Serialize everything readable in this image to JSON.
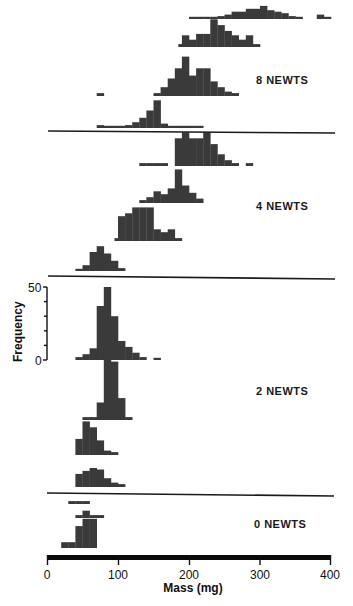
{
  "chart_data": {
    "type": "bar",
    "title": "",
    "xlabel": "Mass (mg)",
    "ylabel": "Frequency",
    "xlim": [
      0,
      400
    ],
    "x_ticks": [
      0,
      100,
      200,
      300,
      400
    ],
    "y_ticks_scale": [
      0,
      50
    ],
    "y_tick_labels": [
      "0",
      "50"
    ],
    "bin_width_mg": 10,
    "grid": false,
    "groups": [
      {
        "label": "8 NEWTS",
        "histograms": [
          {
            "name": "8 newts row 1",
            "bins": [
              [
                200,
                1
              ],
              [
                210,
                1
              ],
              [
                220,
                1
              ],
              [
                230,
                1
              ],
              [
                240,
                2
              ],
              [
                250,
                3
              ],
              [
                260,
                5
              ],
              [
                270,
                5
              ],
              [
                280,
                7
              ],
              [
                290,
                7
              ],
              [
                300,
                9
              ],
              [
                310,
                6
              ],
              [
                320,
                5
              ],
              [
                330,
                4
              ],
              [
                340,
                2
              ],
              [
                350,
                1
              ],
              [
                380,
                3
              ],
              [
                390,
                1
              ]
            ]
          },
          {
            "name": "8 newts row 2",
            "bins": [
              [
                185,
                2
              ],
              [
                190,
                8
              ],
              [
                200,
                5
              ],
              [
                210,
                9
              ],
              [
                220,
                9
              ],
              [
                230,
                19
              ],
              [
                240,
                15
              ],
              [
                250,
                11
              ],
              [
                260,
                8
              ],
              [
                270,
                5
              ],
              [
                280,
                8
              ],
              [
                290,
                2
              ]
            ]
          },
          {
            "name": "8 newts row 3",
            "bins": [
              [
                70,
                2
              ],
              [
                150,
                2
              ],
              [
                160,
                6
              ],
              [
                170,
                12
              ],
              [
                180,
                19
              ],
              [
                190,
                27
              ],
              [
                200,
                14
              ],
              [
                210,
                19
              ],
              [
                220,
                19
              ],
              [
                230,
                10
              ],
              [
                240,
                6
              ],
              [
                250,
                3
              ],
              [
                260,
                2
              ]
            ]
          },
          {
            "name": "8 newts row 4",
            "bins": [
              [
                70,
                2
              ],
              [
                80,
                1
              ],
              [
                90,
                1
              ],
              [
                100,
                1
              ],
              [
                110,
                2
              ],
              [
                120,
                4
              ],
              [
                130,
                7
              ],
              [
                140,
                12
              ],
              [
                150,
                19
              ],
              [
                160,
                3
              ],
              [
                170,
                1
              ],
              [
                180,
                1
              ],
              [
                190,
                1
              ],
              [
                200,
                1
              ],
              [
                210,
                1
              ]
            ]
          }
        ]
      },
      {
        "label": "4 NEWTS",
        "histograms": [
          {
            "name": "4 newts row 1",
            "bins": [
              [
                130,
                2
              ],
              [
                140,
                2
              ],
              [
                150,
                2
              ],
              [
                160,
                2
              ],
              [
                180,
                19
              ],
              [
                190,
                23
              ],
              [
                200,
                19
              ],
              [
                210,
                19
              ],
              [
                220,
                23
              ],
              [
                230,
                15
              ],
              [
                240,
                8
              ],
              [
                250,
                4
              ],
              [
                260,
                2
              ],
              [
                280,
                2
              ]
            ]
          },
          {
            "name": "4 newts row 2",
            "bins": [
              [
                130,
                2
              ],
              [
                140,
                4
              ],
              [
                150,
                8
              ],
              [
                160,
                6
              ],
              [
                170,
                10
              ],
              [
                180,
                23
              ],
              [
                190,
                12
              ],
              [
                200,
                7
              ],
              [
                210,
                3
              ]
            ]
          },
          {
            "name": "4 newts row 3",
            "bins": [
              [
                95,
                2
              ],
              [
                100,
                17
              ],
              [
                110,
                19
              ],
              [
                120,
                23
              ],
              [
                130,
                23
              ],
              [
                140,
                23
              ],
              [
                150,
                8
              ],
              [
                160,
                6
              ],
              [
                170,
                8
              ],
              [
                180,
                2
              ]
            ]
          },
          {
            "name": "4 newts row 4",
            "bins": [
              [
                40,
                1
              ],
              [
                50,
                4
              ],
              [
                60,
                13
              ],
              [
                70,
                17
              ],
              [
                80,
                12
              ],
              [
                90,
                7
              ],
              [
                100,
                2
              ]
            ]
          }
        ]
      },
      {
        "label": "2 NEWTS",
        "histograms": [
          {
            "name": "2 newts row 1",
            "bins": [
              [
                40,
                2
              ],
              [
                50,
                4
              ],
              [
                60,
                8
              ],
              [
                70,
                37
              ],
              [
                80,
                50
              ],
              [
                90,
                30
              ],
              [
                100,
                13
              ],
              [
                110,
                9
              ],
              [
                120,
                5
              ],
              [
                130,
                2
              ],
              [
                150,
                1
              ]
            ]
          },
          {
            "name": "2 newts row 2",
            "bins": [
              [
                50,
                2
              ],
              [
                60,
                2
              ],
              [
                70,
                12
              ],
              [
                80,
                48
              ],
              [
                90,
                40
              ],
              [
                100,
                15
              ],
              [
                110,
                2
              ]
            ]
          },
          {
            "name": "2 newts row 3",
            "bins": [
              [
                40,
                11
              ],
              [
                50,
                23
              ],
              [
                60,
                19
              ],
              [
                70,
                10
              ],
              [
                80,
                3
              ],
              [
                90,
                2
              ]
            ]
          },
          {
            "name": "2 newts row 4",
            "bins": [
              [
                40,
                9
              ],
              [
                50,
                11
              ],
              [
                60,
                13
              ],
              [
                70,
                12
              ],
              [
                80,
                6
              ],
              [
                90,
                3
              ],
              [
                100,
                2
              ]
            ]
          }
        ]
      },
      {
        "label": "0 NEWTS",
        "histograms": [
          {
            "name": "0 newts row 1",
            "bins": [
              [
                30,
                2
              ],
              [
                40,
                2
              ],
              [
                50,
                2
              ]
            ]
          },
          {
            "name": "0 newts row 2",
            "bins": [
              [
                40,
                2
              ],
              [
                50,
                5
              ],
              [
                60,
                2
              ],
              [
                70,
                2
              ]
            ]
          },
          {
            "name": "0 newts row 3",
            "bins": [
              [
                20,
                4
              ],
              [
                30,
                4
              ],
              [
                40,
                15
              ],
              [
                50,
                20
              ],
              [
                60,
                20
              ]
            ]
          }
        ]
      }
    ]
  },
  "labels": {
    "group_8": "8 NEWTS",
    "group_4": "4 NEWTS",
    "group_2": "2 NEWTS",
    "group_0": "0 NEWTS",
    "xlabel": "Mass (mg)",
    "ylabel": "Frequency",
    "x_tick_0": "0",
    "x_tick_100": "100",
    "x_tick_200": "200",
    "x_tick_300": "300",
    "x_tick_400": "400",
    "y_tick_0": "0",
    "y_tick_50": "50"
  }
}
